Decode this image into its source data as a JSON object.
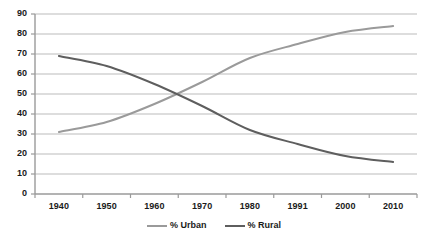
{
  "chart_data": {
    "type": "line",
    "title": "",
    "subtitle": "",
    "xlabel": "",
    "ylabel": "",
    "x": [
      "1940",
      "1950",
      "1960",
      "1970",
      "1980",
      "1991",
      "2000",
      "2010"
    ],
    "categories": [
      "1940",
      "1950",
      "1960",
      "1970",
      "1980",
      "1991",
      "2000",
      "2010"
    ],
    "series": [
      {
        "name": "% Urban",
        "color": "#9a9a9a",
        "values": [
          31,
          36,
          45,
          56,
          68,
          75,
          81,
          84
        ]
      },
      {
        "name": "% Rural",
        "color": "#5e5e5e",
        "values": [
          69,
          64,
          55,
          44,
          32,
          25,
          19,
          16
        ]
      }
    ],
    "ylim": [
      0,
      90
    ],
    "ytick_labels": [
      "0",
      "10",
      "20",
      "30",
      "40",
      "50",
      "60",
      "70",
      "80",
      "90"
    ],
    "ytick_values": [
      0,
      10,
      20,
      30,
      40,
      50,
      60,
      70,
      80,
      90
    ],
    "grid": true,
    "grid_axis": "y",
    "grid_color": "#b3b3b3",
    "axis_color": "#9a9a9a",
    "legend_position": "bottom",
    "background": "#ffffff"
  },
  "legend": {
    "entries": [
      {
        "label": "% Urban"
      },
      {
        "label": "% Rural"
      }
    ]
  },
  "axes": {
    "y": {
      "labels": [
        "90",
        "80",
        "70",
        "60",
        "50",
        "40",
        "30",
        "20",
        "10",
        "0"
      ]
    },
    "x": {
      "labels": [
        "1940",
        "1950",
        "1960",
        "1970",
        "1980",
        "1991",
        "2000",
        "2010"
      ]
    }
  }
}
